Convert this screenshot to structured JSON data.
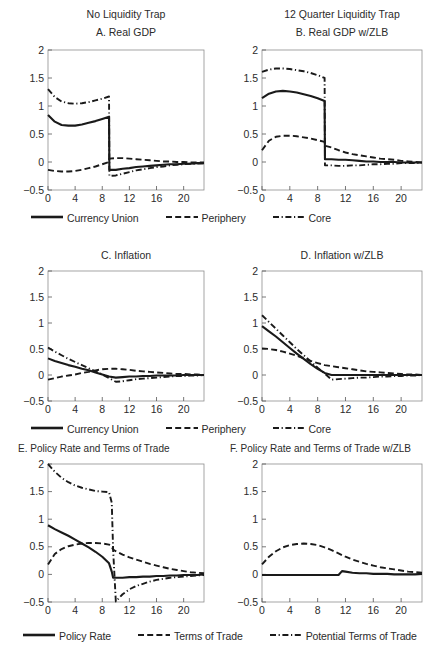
{
  "figure": {
    "width": 447,
    "height": 663,
    "background": "#ffffff",
    "ink": "#1a1a1a"
  },
  "column_titles": [
    {
      "label": "No Liquidity Trap"
    },
    {
      "label": "12 Quarter Liquidity Trap"
    }
  ],
  "legends": [
    {
      "id": "legend-gdp-inflation-top",
      "items": [
        {
          "label": "Currency Union",
          "style": "solid",
          "key": "solid-line-key"
        },
        {
          "label": "Periphery",
          "style": "dashed",
          "key": "dashed-line-key"
        },
        {
          "label": "Core",
          "style": "dashdot",
          "key": "dashdot-line-key"
        }
      ]
    },
    {
      "id": "legend-gdp-inflation-middle",
      "items": [
        {
          "label": "Currency Union",
          "style": "solid",
          "key": "solid-line-key"
        },
        {
          "label": "Periphery",
          "style": "dashed",
          "key": "dashed-line-key"
        },
        {
          "label": "Core",
          "style": "dashdot",
          "key": "dashdot-line-key"
        }
      ]
    },
    {
      "id": "legend-policy-rate-bottom",
      "items": [
        {
          "label": "Policy Rate",
          "style": "solid",
          "key": "solid-line-key"
        },
        {
          "label": "Terms of Trade",
          "style": "dashed",
          "key": "dashed-line-key"
        },
        {
          "label": "Potential Terms of Trade",
          "style": "dashdot",
          "key": "dashdot-line-key"
        }
      ]
    }
  ],
  "chart_data": [
    {
      "id": "panel-a",
      "type": "line",
      "title": "A. Real GDP",
      "xlabel": "",
      "ylabel": "",
      "xlim": [
        0,
        23
      ],
      "ylim": [
        -0.5,
        2
      ],
      "xticks": [
        0,
        4,
        8,
        12,
        16,
        20
      ],
      "yticks": [
        -0.5,
        0,
        0.5,
        1,
        1.5,
        2
      ],
      "ytick_labels": [
        "-0.5",
        "0",
        "0.5",
        "1",
        "1.5",
        "2"
      ],
      "grid": false,
      "legend_position": "below-figure",
      "x": [
        0,
        1,
        2,
        3,
        4,
        5,
        6,
        7,
        8,
        9,
        9.05,
        10,
        11,
        12,
        13,
        14,
        15,
        16,
        17,
        18,
        19,
        20,
        21,
        22,
        23
      ],
      "series": [
        {
          "name": "Currency Union",
          "style": "solid",
          "values": [
            0.84,
            0.72,
            0.66,
            0.65,
            0.65,
            0.67,
            0.7,
            0.73,
            0.77,
            0.81,
            -0.14,
            -0.14,
            -0.12,
            -0.11,
            -0.09,
            -0.08,
            -0.07,
            -0.06,
            -0.05,
            -0.04,
            -0.04,
            -0.03,
            -0.03,
            -0.02,
            -0.02
          ]
        },
        {
          "name": "Periphery",
          "style": "dashed",
          "values": [
            -0.14,
            -0.16,
            -0.17,
            -0.17,
            -0.16,
            -0.14,
            -0.11,
            -0.08,
            -0.04,
            0.0,
            0.06,
            0.07,
            0.07,
            0.06,
            0.05,
            0.04,
            0.03,
            0.02,
            0.01,
            0.01,
            0.0,
            0.0,
            -0.01,
            -0.01,
            -0.01
          ]
        },
        {
          "name": "Core",
          "style": "dashdot",
          "values": [
            1.3,
            1.16,
            1.08,
            1.05,
            1.04,
            1.05,
            1.07,
            1.1,
            1.13,
            1.17,
            -0.25,
            -0.24,
            -0.21,
            -0.18,
            -0.15,
            -0.13,
            -0.11,
            -0.09,
            -0.08,
            -0.06,
            -0.05,
            -0.04,
            -0.03,
            -0.03,
            -0.02
          ]
        }
      ]
    },
    {
      "id": "panel-b",
      "type": "line",
      "title": "B. Real GDP w/ZLB",
      "xlabel": "",
      "ylabel": "",
      "xlim": [
        0,
        23
      ],
      "ylim": [
        -0.5,
        2
      ],
      "xticks": [
        0,
        4,
        8,
        12,
        16,
        20
      ],
      "yticks": [
        -0.5,
        0,
        0.5,
        1,
        1.5,
        2
      ],
      "ytick_labels": [
        "-0.5",
        "0",
        "0.5",
        "1",
        "1.5",
        "2"
      ],
      "grid": false,
      "legend_position": "below-figure",
      "x": [
        0,
        1,
        2,
        3,
        4,
        5,
        6,
        7,
        8,
        9,
        9.05,
        10,
        11,
        12,
        13,
        14,
        15,
        16,
        17,
        18,
        19,
        20,
        21,
        22,
        23
      ],
      "series": [
        {
          "name": "Currency Union",
          "style": "solid",
          "values": [
            1.14,
            1.22,
            1.26,
            1.27,
            1.26,
            1.24,
            1.21,
            1.18,
            1.14,
            1.09,
            0.05,
            0.05,
            0.04,
            0.04,
            0.03,
            0.02,
            0.01,
            0.01,
            0.0,
            0.0,
            0.0,
            -0.01,
            -0.01,
            -0.01,
            -0.01
          ]
        },
        {
          "name": "Periphery",
          "style": "dashed",
          "values": [
            0.21,
            0.38,
            0.45,
            0.47,
            0.47,
            0.46,
            0.44,
            0.42,
            0.39,
            0.36,
            0.29,
            0.26,
            0.21,
            0.17,
            0.14,
            0.12,
            0.1,
            0.08,
            0.06,
            0.05,
            0.04,
            0.02,
            0.01,
            0.0,
            -0.01
          ]
        },
        {
          "name": "Core",
          "style": "dashdot",
          "values": [
            1.61,
            1.65,
            1.67,
            1.67,
            1.66,
            1.64,
            1.62,
            1.59,
            1.55,
            1.5,
            -0.06,
            -0.06,
            -0.07,
            -0.07,
            -0.06,
            -0.06,
            -0.05,
            -0.04,
            -0.04,
            -0.03,
            -0.03,
            -0.02,
            -0.02,
            -0.02,
            -0.01
          ]
        }
      ]
    },
    {
      "id": "panel-c",
      "type": "line",
      "title": "C. Inflation",
      "xlabel": "",
      "ylabel": "",
      "xlim": [
        0,
        23
      ],
      "ylim": [
        -0.5,
        2
      ],
      "xticks": [
        0,
        4,
        8,
        12,
        16,
        20
      ],
      "yticks": [
        -0.5,
        0,
        0.5,
        1,
        1.5,
        2
      ],
      "ytick_labels": [
        "-0.5",
        "0",
        "0.5",
        "1",
        "1.5",
        "2"
      ],
      "grid": false,
      "legend_position": "below-figure",
      "x": [
        0,
        1,
        2,
        3,
        4,
        5,
        6,
        7,
        8,
        9,
        10,
        11,
        12,
        13,
        14,
        15,
        16,
        17,
        18,
        19,
        20,
        21,
        22,
        23
      ],
      "series": [
        {
          "name": "Currency Union",
          "style": "solid",
          "values": [
            0.32,
            0.27,
            0.23,
            0.19,
            0.16,
            0.12,
            0.09,
            0.05,
            0.01,
            -0.03,
            -0.05,
            -0.04,
            -0.03,
            -0.03,
            -0.02,
            -0.02,
            -0.01,
            -0.01,
            -0.01,
            -0.01,
            0.0,
            0.0,
            0.0,
            0.0
          ]
        },
        {
          "name": "Periphery",
          "style": "dashed",
          "values": [
            -0.09,
            -0.06,
            -0.03,
            -0.01,
            0.01,
            0.04,
            0.06,
            0.09,
            0.11,
            0.12,
            0.12,
            0.11,
            0.1,
            0.08,
            0.07,
            0.06,
            0.05,
            0.04,
            0.03,
            0.02,
            0.02,
            0.01,
            0.01,
            0.0
          ]
        },
        {
          "name": "Core",
          "style": "dashdot",
          "values": [
            0.53,
            0.45,
            0.38,
            0.31,
            0.25,
            0.19,
            0.13,
            0.07,
            0.01,
            -0.06,
            -0.13,
            -0.12,
            -0.1,
            -0.08,
            -0.07,
            -0.06,
            -0.05,
            -0.04,
            -0.03,
            -0.02,
            -0.02,
            -0.01,
            -0.01,
            0.0
          ]
        }
      ]
    },
    {
      "id": "panel-d",
      "type": "line",
      "title": "D. Inflation w/ZLB",
      "xlabel": "",
      "ylabel": "",
      "xlim": [
        0,
        23
      ],
      "ylim": [
        -0.5,
        2
      ],
      "xticks": [
        0,
        4,
        8,
        12,
        16,
        20
      ],
      "yticks": [
        -0.5,
        0,
        0.5,
        1,
        1.5,
        2
      ],
      "ytick_labels": [
        "-0.5",
        "0",
        "0.5",
        "1",
        "1.5",
        "2"
      ],
      "grid": false,
      "legend_position": "below-figure",
      "x": [
        0,
        1,
        2,
        3,
        4,
        5,
        6,
        7,
        8,
        9,
        10,
        11,
        12,
        13,
        14,
        15,
        16,
        17,
        18,
        19,
        20,
        21,
        22,
        23
      ],
      "series": [
        {
          "name": "Currency Union",
          "style": "solid",
          "values": [
            0.94,
            0.84,
            0.74,
            0.63,
            0.52,
            0.41,
            0.31,
            0.21,
            0.12,
            0.04,
            0.0,
            0.0,
            0.0,
            0.0,
            0.0,
            0.0,
            0.0,
            0.0,
            0.0,
            0.0,
            0.0,
            0.0,
            0.0,
            0.0
          ]
        },
        {
          "name": "Periphery",
          "style": "dashed",
          "values": [
            0.51,
            0.5,
            0.48,
            0.45,
            0.41,
            0.37,
            0.32,
            0.27,
            0.23,
            0.19,
            0.17,
            0.15,
            0.13,
            0.11,
            0.09,
            0.07,
            0.06,
            0.05,
            0.04,
            0.03,
            0.02,
            0.01,
            0.01,
            0.0
          ]
        },
        {
          "name": "Core",
          "style": "dashdot",
          "values": [
            1.15,
            1.02,
            0.89,
            0.76,
            0.63,
            0.5,
            0.38,
            0.26,
            0.14,
            0.03,
            -0.09,
            -0.08,
            -0.07,
            -0.06,
            -0.05,
            -0.05,
            -0.04,
            -0.03,
            -0.03,
            -0.02,
            -0.02,
            -0.01,
            -0.01,
            0.0
          ]
        }
      ]
    },
    {
      "id": "panel-e",
      "type": "line",
      "title": "E. Policy Rate and Terms of Trade",
      "xlabel": "",
      "ylabel": "",
      "xlim": [
        0,
        23
      ],
      "ylim": [
        -0.5,
        2
      ],
      "xticks": [
        0,
        4,
        8,
        12,
        16,
        20
      ],
      "yticks": [
        -0.5,
        0,
        0.5,
        1,
        1.5,
        2
      ],
      "ytick_labels": [
        "-0.5",
        "0",
        "0.5",
        "1",
        "1.5",
        "2"
      ],
      "grid": false,
      "legend_position": "below-figure",
      "x": [
        0,
        1,
        2,
        3,
        4,
        5,
        6,
        7,
        8,
        9,
        9.4,
        9.6,
        10,
        11,
        12,
        13,
        14,
        15,
        16,
        17,
        18,
        19,
        20,
        21,
        22,
        23
      ],
      "series": [
        {
          "name": "Policy Rate",
          "style": "solid",
          "values": [
            0.89,
            0.82,
            0.76,
            0.7,
            0.63,
            0.56,
            0.49,
            0.41,
            0.32,
            0.2,
            0.05,
            -0.06,
            -0.06,
            -0.06,
            -0.05,
            -0.05,
            -0.04,
            -0.04,
            -0.03,
            -0.03,
            -0.02,
            -0.02,
            -0.01,
            -0.01,
            -0.01,
            0.0
          ]
        },
        {
          "name": "Terms of Trade",
          "style": "dashed",
          "values": [
            0.18,
            0.37,
            0.46,
            0.51,
            0.54,
            0.56,
            0.57,
            0.57,
            0.56,
            0.54,
            0.5,
            0.45,
            0.42,
            0.36,
            0.31,
            0.27,
            0.23,
            0.19,
            0.16,
            0.13,
            0.1,
            0.08,
            0.06,
            0.04,
            0.03,
            0.02
          ]
        },
        {
          "name": "Potential Terms of Trade",
          "style": "dashdot",
          "values": [
            2.0,
            1.86,
            1.75,
            1.67,
            1.61,
            1.57,
            1.54,
            1.51,
            1.5,
            1.49,
            1.3,
            0.45,
            -0.49,
            -0.36,
            -0.27,
            -0.21,
            -0.17,
            -0.13,
            -0.1,
            -0.08,
            -0.06,
            -0.05,
            -0.04,
            -0.03,
            -0.02,
            -0.01
          ]
        }
      ]
    },
    {
      "id": "panel-f",
      "type": "line",
      "title": "F. Policy Rate and Terms of Trade w/ZLB",
      "xlabel": "",
      "ylabel": "",
      "xlim": [
        0,
        23
      ],
      "ylim": [
        -0.5,
        2
      ],
      "xticks": [
        0,
        4,
        8,
        12,
        16,
        20
      ],
      "yticks": [
        -0.5,
        0,
        0.5,
        1,
        1.5,
        2
      ],
      "ytick_labels": [
        "-0.5",
        "0",
        "0.5",
        "1",
        "1.5",
        "2"
      ],
      "grid": false,
      "legend_position": "below-figure",
      "x": [
        0,
        1,
        2,
        3,
        4,
        5,
        6,
        7,
        8,
        9,
        10,
        11,
        11.5,
        12,
        13,
        14,
        15,
        16,
        17,
        18,
        19,
        20,
        21,
        22,
        23
      ],
      "series": [
        {
          "name": "Policy Rate",
          "style": "solid",
          "values": [
            -0.01,
            -0.01,
            -0.01,
            -0.01,
            -0.01,
            -0.01,
            -0.01,
            -0.01,
            -0.01,
            -0.01,
            -0.01,
            -0.01,
            0.06,
            0.05,
            0.03,
            0.02,
            0.02,
            0.01,
            0.01,
            0.01,
            0.0,
            0.0,
            0.0,
            0.0,
            0.01
          ]
        },
        {
          "name": "Terms of Trade",
          "style": "dashed",
          "values": [
            0.18,
            0.32,
            0.42,
            0.49,
            0.53,
            0.55,
            0.56,
            0.55,
            0.53,
            0.49,
            0.44,
            0.38,
            0.35,
            0.32,
            0.27,
            0.23,
            0.19,
            0.16,
            0.13,
            0.11,
            0.09,
            0.07,
            0.05,
            0.04,
            0.03
          ]
        }
      ]
    }
  ]
}
